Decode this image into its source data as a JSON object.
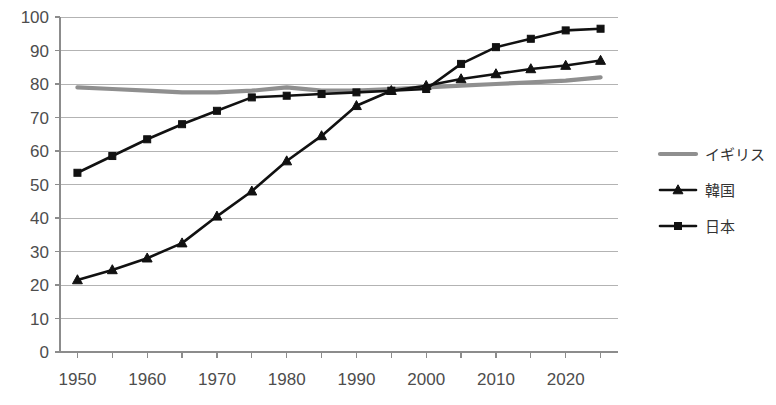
{
  "chart_data": {
    "type": "line",
    "title": "",
    "xlabel": "",
    "ylabel": "",
    "xlim": [
      1947.5,
      2027.5
    ],
    "ylim": [
      0,
      100
    ],
    "grid": true,
    "legend_position": "right",
    "x": [
      1950,
      1955,
      1960,
      1965,
      1970,
      1975,
      1980,
      1985,
      1990,
      1995,
      2000,
      2005,
      2010,
      2015,
      2020,
      2025
    ],
    "xticks": [
      1950,
      1960,
      1970,
      1980,
      1990,
      2000,
      2010,
      2020
    ],
    "xtick_labels": [
      "1950",
      "1960",
      "1970",
      "1980",
      "1990",
      "2000",
      "2010",
      "2020"
    ],
    "xminor_ticks": [
      1950,
      1955,
      1960,
      1965,
      1970,
      1975,
      1980,
      1985,
      1990,
      1995,
      2000,
      2005,
      2010,
      2015,
      2020,
      2025
    ],
    "yticks": [
      0,
      10,
      20,
      30,
      40,
      50,
      60,
      70,
      80,
      90,
      100
    ],
    "ytick_labels": [
      "0",
      "10",
      "20",
      "30",
      "40",
      "50",
      "60",
      "70",
      "80",
      "90",
      "100"
    ],
    "series": [
      {
        "name": "イギリス",
        "color": "#8f8f8f",
        "marker": "none",
        "values": [
          79,
          78.5,
          78,
          77.5,
          77.5,
          78,
          79,
          78,
          78,
          78.5,
          79,
          79.5,
          80,
          80.5,
          81,
          82
        ]
      },
      {
        "name": "韓国",
        "color": "#111111",
        "marker": "triangle",
        "values": [
          21.5,
          24.5,
          28,
          32.5,
          40.5,
          48,
          57,
          64.5,
          73.5,
          78,
          79.5,
          81.5,
          83,
          84.5,
          85.5,
          87
        ]
      },
      {
        "name": "日本",
        "color": "#111111",
        "marker": "square",
        "values": [
          53.5,
          58.5,
          63.5,
          68,
          72,
          76,
          76.5,
          77,
          77.5,
          78,
          78.5,
          86,
          91,
          93.5,
          96,
          96.5
        ]
      }
    ]
  },
  "legend": {
    "items": [
      {
        "label": "イギリス",
        "color": "#8f8f8f",
        "marker": "none"
      },
      {
        "label": "韓国",
        "color": "#111111",
        "marker": "triangle"
      },
      {
        "label": "日本",
        "color": "#111111",
        "marker": "square"
      }
    ]
  }
}
